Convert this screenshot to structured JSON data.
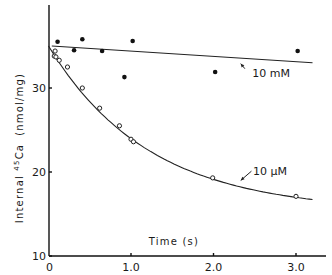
{
  "chart_data": {
    "type": "scatter",
    "title": "",
    "xlabel": "Time (s)",
    "ylabel": "Internal 45Ca (nmol/mg)",
    "ylabel_parts": {
      "prefix": "Internal ",
      "superscript": "45",
      "element": "Ca",
      "units": "(nmol/mg)"
    },
    "xlim": [
      0,
      3.3
    ],
    "ylim": [
      10,
      37
    ],
    "x_ticks": [
      0,
      1.0,
      2.0,
      3.0
    ],
    "x_tick_labels": [
      "0",
      "1.0",
      "2.0",
      "3.0"
    ],
    "y_ticks": [
      10,
      20,
      30
    ],
    "y_tick_labels": [
      "10",
      "20",
      "30"
    ],
    "grid": false,
    "legend": "none (inline labels)",
    "series": [
      {
        "name": "10 mM",
        "marker": "filled-circle",
        "points": [
          {
            "x": 0.11,
            "y": 35.5
          },
          {
            "x": 0.31,
            "y": 34.5
          },
          {
            "x": 0.41,
            "y": 35.8
          },
          {
            "x": 0.65,
            "y": 34.4
          },
          {
            "x": 0.92,
            "y": 31.3
          },
          {
            "x": 1.02,
            "y": 35.6
          },
          {
            "x": 2.02,
            "y": 31.9
          },
          {
            "x": 3.02,
            "y": 34.4
          }
        ],
        "fit": {
          "kind": "linear",
          "points": [
            {
              "x": 0.04,
              "y": 35.0
            },
            {
              "x": 3.2,
              "y": 33.0
            }
          ]
        },
        "label_pos": {
          "x": 2.47,
          "y": 31.3
        },
        "arrow": {
          "from": {
            "x": 2.38,
            "y": 32.3
          },
          "to": {
            "x": 2.33,
            "y": 32.9
          }
        }
      },
      {
        "name": "10 μM",
        "marker": "open-circle",
        "points": [
          {
            "x": 0.08,
            "y": 34.4
          },
          {
            "x": 0.07,
            "y": 33.8
          },
          {
            "x": 0.09,
            "y": 33.7
          },
          {
            "x": 0.13,
            "y": 33.3
          },
          {
            "x": 0.23,
            "y": 32.5
          },
          {
            "x": 0.41,
            "y": 30.0
          },
          {
            "x": 0.62,
            "y": 27.6
          },
          {
            "x": 0.86,
            "y": 25.5
          },
          {
            "x": 1.0,
            "y": 23.9
          },
          {
            "x": 1.03,
            "y": 23.6
          },
          {
            "x": 1.99,
            "y": 19.3
          },
          {
            "x": 3.0,
            "y": 17.1
          }
        ],
        "fit": {
          "kind": "exponential-decay",
          "y0": 35.0,
          "plateau": 15.3,
          "k": 0.82,
          "x_range": [
            0.0,
            3.2
          ]
        },
        "label_pos": {
          "x": 2.48,
          "y": 19.7
        },
        "arrow": {
          "from": {
            "x": 2.46,
            "y": 20.1
          },
          "to": {
            "x": 2.33,
            "y": 19.0
          }
        }
      }
    ],
    "colors": {
      "ink": "#111111",
      "background": "#ffffff"
    }
  }
}
